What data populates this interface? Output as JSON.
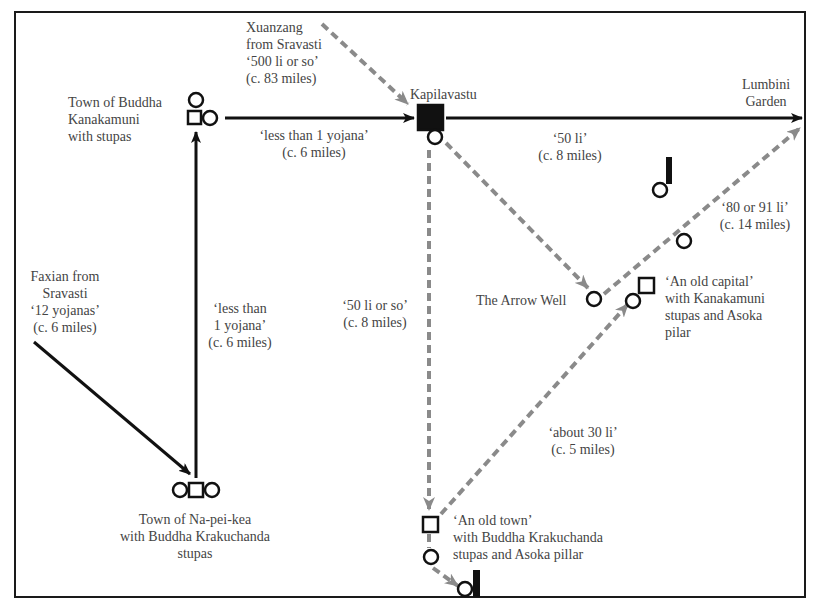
{
  "diagram": {
    "type": "route-map",
    "colors": {
      "frame": "#1a1a1a",
      "faxian_route": "#111111",
      "xuanzang_route": "#8a8a8a",
      "text": "#444444",
      "background": "#ffffff"
    },
    "legend_symbols": {
      "circle": "stupa",
      "square": "town",
      "filled_square": "city",
      "bar": "pillar"
    },
    "places": {
      "kanakamuni_town": "Town of Buddha\nKanakamuni\nwith stupas",
      "kapilavastu": "Kapilavastu",
      "lumbini": "Lumbini\nGarden",
      "napeikea": "Town of Na-pei-kea\nwith Buddha Krakuchanda\nstupas",
      "arrow_well": "The Arrow Well",
      "old_capital": "‘An old capital’\nwith Kanakamuni\nstupas and Asoka\npilar",
      "old_town": "‘An old town’\nwith Buddha Krakuchanda\nstupas and Asoka pillar"
    },
    "routes": {
      "xuanzang_from_sravasti": "Xuanzang\nfrom Sravasti\n‘500 li or so’\n(c. 83 miles)",
      "faxian_from_sravasti": "Faxian from\nSravasti\n‘12 yojanas’\n(c. 6 miles)",
      "kanakamuni_to_kapilavastu": "‘less than 1 yojana’\n(c. 6 miles)",
      "napeikea_to_kanakamuni": "‘less than\n1 yojana’\n(c. 6 miles)",
      "kapilavastu_to_lumbini": "‘50 li’\n(c. 8 miles)",
      "kapilavastu_to_oldtown": "‘50 li or so’\n(c. 8 miles)",
      "arrowwell_to_lumbini": "‘80 or 91 li’\n(c. 14 miles)",
      "oldtown_to_oldcapital": "‘about 30 li’\n(c. 5 miles)"
    }
  }
}
